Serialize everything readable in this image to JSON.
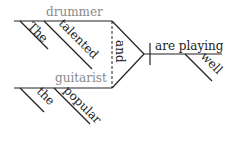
{
  "diagram": {
    "type": "sentence-diagram",
    "subjects": [
      {
        "noun": "drummer",
        "modifiers": [
          "The",
          "talented"
        ]
      },
      {
        "noun": "guitarist",
        "modifiers": [
          "the",
          "popular"
        ]
      }
    ],
    "conjunction": "and",
    "predicate": {
      "verb": "are playing",
      "modifiers": [
        "well"
      ]
    },
    "colors": {
      "text": "#222222",
      "subject_text": "#8a8a8a",
      "lines": "#222222"
    }
  }
}
